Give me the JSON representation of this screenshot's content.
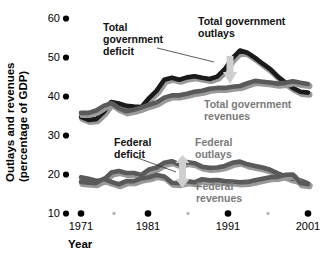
{
  "chart_data": {
    "type": "line",
    "title": "",
    "xlabel": "Year",
    "ylabel": "Outlays and revenues (percentage of GDP)",
    "ylabel_line1": "Outlays and revenues",
    "ylabel_line2": "(percentage of GDP)",
    "xlim": [
      1971,
      2001
    ],
    "ylim": [
      10,
      60
    ],
    "yticks": [
      60,
      50,
      40,
      30,
      20,
      10
    ],
    "ytick_labels": [
      "60",
      "50",
      "40",
      "30",
      "20",
      "10"
    ],
    "xticks": [
      1971,
      1981,
      1991,
      2001
    ],
    "xtick_labels": [
      "1971",
      "1981",
      "1991",
      "2001"
    ],
    "xminor_ticks": [
      1976,
      1986,
      1996
    ],
    "grid": false,
    "legend_position": "inline-annotations",
    "x": [
      1971,
      1972,
      1973,
      1974,
      1975,
      1976,
      1977,
      1978,
      1979,
      1980,
      1981,
      1982,
      1983,
      1984,
      1985,
      1986,
      1987,
      1988,
      1989,
      1990,
      1991,
      1992,
      1993,
      1994,
      1995,
      1996,
      1997,
      1998,
      1999,
      2000,
      2001
    ],
    "series": [
      {
        "name": "Total government outlays",
        "color": "#1a1a1a",
        "values": [
          34.8,
          34.0,
          34.2,
          36.0,
          38.6,
          38.2,
          37.6,
          37.4,
          37.3,
          39.6,
          41.5,
          44.3,
          44.8,
          44.3,
          44.9,
          45.2,
          44.8,
          44.5,
          45.1,
          47.0,
          49.8,
          51.8,
          51.2,
          49.9,
          48.4,
          47.0,
          45.1,
          43.6,
          42.2,
          41.2,
          41.0
        ]
      },
      {
        "name": "Total government revenues",
        "color": "#5a5a5a",
        "values": [
          35.8,
          35.8,
          36.4,
          37.6,
          38.3,
          37.0,
          36.2,
          36.6,
          37.2,
          37.9,
          38.5,
          39.7,
          40.3,
          40.3,
          40.7,
          41.2,
          41.5,
          42.0,
          42.2,
          42.2,
          42.5,
          42.7,
          43.4,
          44.0,
          43.8,
          43.6,
          43.3,
          43.5,
          43.9,
          43.5,
          43.2
        ]
      },
      {
        "name": "Federal outlays",
        "color": "#5a5a5a",
        "values": [
          19.3,
          18.9,
          18.4,
          18.6,
          20.5,
          20.9,
          20.4,
          20.4,
          19.9,
          21.3,
          21.8,
          23.0,
          23.4,
          22.6,
          23.2,
          22.9,
          22.0,
          21.7,
          21.8,
          22.2,
          23.0,
          23.3,
          22.6,
          22.2,
          21.8,
          21.2,
          20.3,
          19.6,
          18.9,
          18.5,
          17.7
        ]
      },
      {
        "name": "Federal revenues",
        "color": "#5a5a5a",
        "values": [
          18.1,
          17.9,
          17.8,
          18.9,
          18.1,
          17.5,
          18.3,
          18.3,
          19.0,
          19.3,
          19.9,
          19.5,
          17.9,
          17.8,
          18.3,
          18.0,
          18.8,
          18.5,
          18.6,
          18.3,
          18.2,
          18.0,
          18.1,
          18.5,
          18.9,
          19.3,
          19.4,
          19.9,
          20.0,
          17.8,
          17.5
        ]
      }
    ],
    "annotations": [
      {
        "id": "total-government-deficit",
        "text": "Total government deficit",
        "line1": "Total",
        "line2": "government",
        "line3": "deficit",
        "style": "bold-dark"
      },
      {
        "id": "total-government-outlays",
        "text": "Total government outlays",
        "line1": "Total government",
        "line2": "outlays",
        "style": "bold-dark"
      },
      {
        "id": "total-government-revenues",
        "text": "Total government revenues",
        "line1": "Total government",
        "line2": "revenues",
        "style": "bold-gray"
      },
      {
        "id": "federal-deficit",
        "text": "Federal deficit",
        "line1": "Federal",
        "line2": "deficit",
        "style": "bold-dark"
      },
      {
        "id": "federal-outlays",
        "text": "Federal outlays",
        "line1": "Federal",
        "line2": "outlays",
        "style": "bold-gray"
      },
      {
        "id": "federal-revenues",
        "text": "Federal revenues",
        "line1": "Federal",
        "line2": "revenues",
        "style": "bold-gray"
      }
    ],
    "gap_arrows": [
      {
        "id": "total-deficit-arrow",
        "direction": "down",
        "color": "#cccccc"
      },
      {
        "id": "federal-deficit-arrow",
        "direction": "both",
        "color": "#cccccc"
      }
    ],
    "colors": {
      "dark_line": "#1a1a1a",
      "gray_line": "#5a5a5a",
      "line_shadow": "#9a9a9a",
      "arrow": "#cfcfcf",
      "gray_text": "#7a7a7a",
      "tick_dot": "#000000",
      "minor_tick_dot": "#b8b8b8",
      "background": "#ffffff"
    }
  }
}
